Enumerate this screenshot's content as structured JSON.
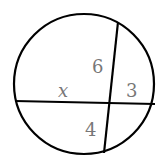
{
  "diagram": {
    "type": "intersecting-chords",
    "circle": {
      "cx": 84,
      "cy": 84,
      "r": 70
    },
    "chords": [
      {
        "name": "horizontal-chord",
        "x1": 15,
        "y1": 101,
        "x2": 155,
        "y2": 104
      },
      {
        "name": "vertical-chord",
        "x1": 118,
        "y1": 22,
        "x2": 104,
        "y2": 153
      }
    ],
    "labels": {
      "x": "x",
      "six": "6",
      "three": "3",
      "four": "4"
    },
    "colors": {
      "stroke": "#000000",
      "label": "#777777"
    }
  }
}
